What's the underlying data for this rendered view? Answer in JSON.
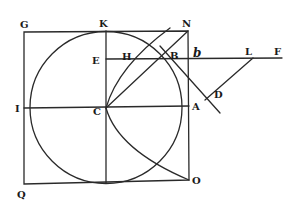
{
  "figure": {
    "type": "geometric-construction",
    "labels": {
      "G": "G",
      "K": "K",
      "N": "N",
      "E": "E",
      "H": "H",
      "B": "B",
      "b": "b",
      "L": "L",
      "F": "F",
      "I": "I",
      "C": "C",
      "A": "A",
      "D": "D",
      "Q": "Q",
      "O": "O"
    },
    "colors": {
      "ink": "#2a2a2a",
      "background": "#ffffff"
    }
  }
}
